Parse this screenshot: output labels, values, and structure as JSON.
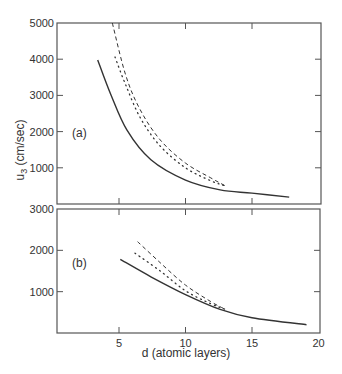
{
  "chart_data": [
    {
      "panel": "(a)",
      "type": "line",
      "ylabel": "u3 (cm/sec)",
      "ylabel_main": "u",
      "ylabel_sub": "3",
      "ylabel_rest": " (cm/sec)",
      "xlabel": "d (atomic layers)",
      "xlim": [
        0,
        20
      ],
      "ylim": [
        0,
        5000
      ],
      "yticks": [
        1000,
        2000,
        3000,
        4000,
        5000
      ],
      "ytick_labels": [
        "1000",
        "2000",
        "3000",
        "4000",
        "5000"
      ],
      "xticks": [
        5,
        10,
        15
      ],
      "grid": false,
      "series": [
        {
          "name": "solid",
          "style": "solid",
          "x": [
            3.4,
            4.4,
            5.6,
            7.4,
            10.0,
            12.6,
            15.0,
            17.8
          ],
          "y": [
            3980,
            3010,
            2040,
            1220,
            660,
            390,
            300,
            190
          ]
        },
        {
          "name": "dashed",
          "style": "dashed",
          "x": [
            4.5,
            5.5,
            6.6,
            8.1,
            10.0,
            11.9,
            13.0
          ],
          "y": [
            5000,
            3560,
            2600,
            1770,
            1130,
            720,
            500
          ]
        },
        {
          "name": "dotted",
          "style": "dotted",
          "x": [
            4.7,
            5.5,
            6.6,
            8.1,
            10.0,
            11.9,
            13.0
          ],
          "y": [
            4060,
            3290,
            2380,
            1600,
            1000,
            640,
            500
          ]
        }
      ]
    },
    {
      "panel": "(b)",
      "type": "line",
      "xlabel": "d (atomic layers)",
      "xlim": [
        0,
        20
      ],
      "ylim": [
        0,
        3000
      ],
      "yticks": [
        1000,
        2000,
        3000
      ],
      "ytick_labels": [
        "1000",
        "2000",
        "3000"
      ],
      "xticks": [
        5,
        10,
        15,
        20
      ],
      "xtick_labels": [
        "5",
        "10",
        "15",
        "20"
      ],
      "grid": false,
      "series": [
        {
          "name": "solid",
          "style": "solid",
          "x": [
            5.1,
            7.4,
            10.0,
            12.6,
            15.0,
            19.1
          ],
          "y": [
            1780,
            1360,
            930,
            570,
            370,
            200
          ]
        },
        {
          "name": "dashed",
          "style": "dashed",
          "x": [
            6.4,
            8.1,
            10.0,
            11.9,
            13.0
          ],
          "y": [
            2210,
            1700,
            1160,
            760,
            570
          ]
        },
        {
          "name": "dotted",
          "style": "dotted",
          "x": [
            6.2,
            8.1,
            10.0,
            11.9,
            13.0
          ],
          "y": [
            1930,
            1500,
            1020,
            710,
            570
          ]
        }
      ]
    }
  ]
}
